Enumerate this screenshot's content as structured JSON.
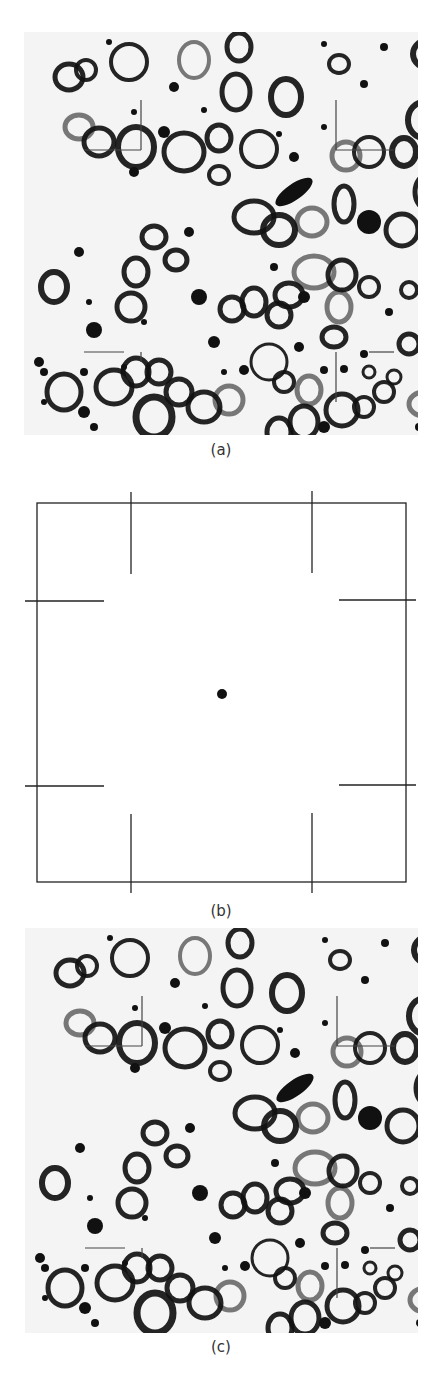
{
  "figure": {
    "panels": [
      {
        "id": "a",
        "caption": "(a)",
        "kind": "micrograph"
      },
      {
        "id": "b",
        "caption": "(b)",
        "kind": "schematic"
      },
      {
        "id": "c",
        "caption": "(c)",
        "kind": "micrograph"
      }
    ]
  },
  "colors": {
    "ink": "#111111",
    "background": "#ffffff",
    "micro_bg": "#f4f4f4"
  }
}
